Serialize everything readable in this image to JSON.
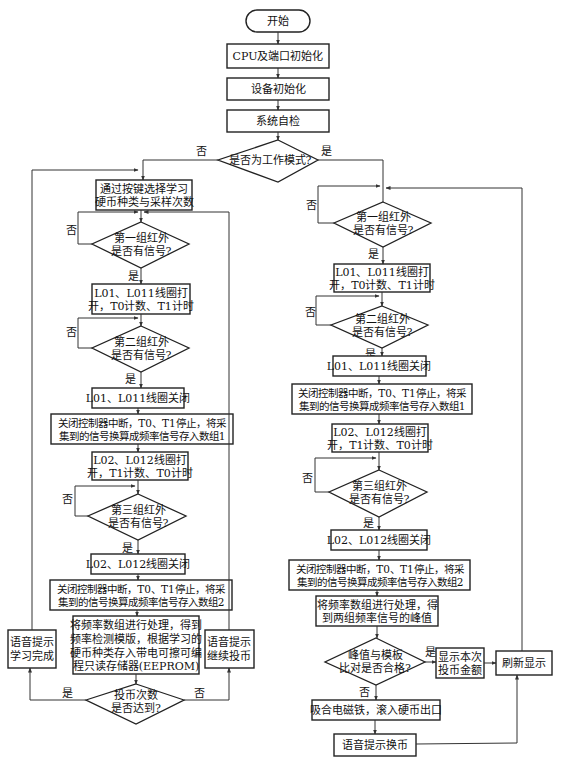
{
  "diagram": {
    "type": "flowchart",
    "start": "开始",
    "init": [
      "CPU及端口初始化",
      "设备初始化",
      "系统自检"
    ],
    "mode_decision": "是否为工作模式?",
    "labels": {
      "yes": "是",
      "no": "否"
    },
    "learn": {
      "select": [
        "通过按键选择学习",
        "硬币种类与采样次数"
      ],
      "ir1": [
        "第一组红外",
        "是否有信号?"
      ],
      "coil1_on": [
        "L01、L011线圈打",
        "开，T0计数、T1计时"
      ],
      "ir2": [
        "第二组红外",
        "是否有信号?"
      ],
      "coil1_off": "L01、L011线圈关闭",
      "store1": [
        "关闭控制器中断，T0、T1停止，将采",
        "集到的信号换算成频率信号存入数组1"
      ],
      "coil2_on": [
        "L02、L012线圈打",
        "开，T1计数、T0计时"
      ],
      "ir3": [
        "第三组红外",
        "是否有信号?"
      ],
      "coil2_off": "L02、L012线圈关闭",
      "store2": [
        "关闭控制器中断，T0、T1停止，将采",
        "集到的信号换算成频率信号存入数组2"
      ],
      "template": [
        "将频率数组进行处理，得到",
        "频率检测模版，根据学习的",
        "硬币种类存入带电可擦可编",
        "程只读存储器(EEPROM)"
      ],
      "count_decision": [
        "投币次数",
        "是否达到?"
      ],
      "done": [
        "语音提示",
        "学习完成"
      ],
      "continue": [
        "语音提示",
        "继续投币"
      ]
    },
    "work": {
      "ir1": [
        "第一组红外",
        "是否有信号?"
      ],
      "coil1_on": [
        "L01、L011线圈打",
        "开，T0计数、T1计时"
      ],
      "ir2": [
        "第二组红外",
        "是否有信号?"
      ],
      "coil1_off": "L01、L011线圈关闭",
      "store1": [
        "关闭控制器中断，T0、T1停止，将采",
        "集到的信号换算成频率信号存入数组1"
      ],
      "coil2_on": [
        "L02、L012线圈打",
        "开，T1计数、T0计时"
      ],
      "ir3": [
        "第三组红外",
        "是否有信号?"
      ],
      "coil2_off": "L02、L012线圈关闭",
      "store2": [
        "关闭控制器中断，T0、T1停止，将采",
        "集到的信号换算成频率信号存入数组2"
      ],
      "peak": [
        "将频率数组进行处理，得",
        "到两组频率信号的峰值"
      ],
      "match_decision": [
        "峰值与模板",
        "比对是否合格?"
      ],
      "show_amount": [
        "显示本次",
        "投币金额"
      ],
      "refresh": "刷新显示",
      "reject": "吸合电磁铁，滚入硬币出口",
      "voice_change": "语音提示换币"
    }
  }
}
